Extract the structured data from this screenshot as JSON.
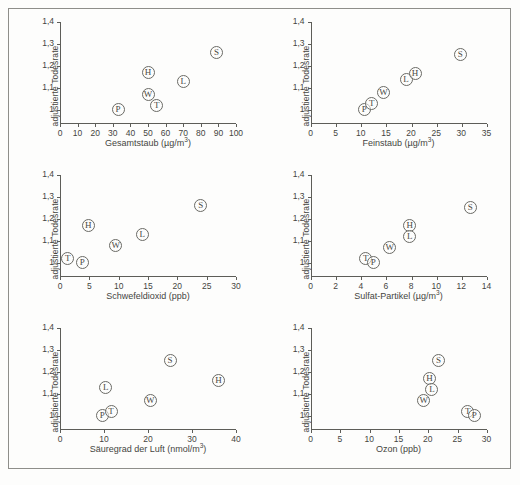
{
  "figure": {
    "background": "#fdfdfc",
    "frame_color": "#8e8e8a",
    "axis_color": "#5d5d58",
    "marker_color": "#6a6a65",
    "ylabel": "adjustierte Todesrate",
    "y_ticks": [
      "1",
      "1,1",
      "1,2",
      "1,3",
      "1,4"
    ],
    "city_codes": [
      "P",
      "T",
      "W",
      "L",
      "H",
      "S"
    ]
  },
  "chart_data": [
    {
      "type": "scatter",
      "title": "",
      "xlabel": "Gesamtstaub (µg/m³)",
      "xlabel_base": "Gesamtstaub (µg/m",
      "xlabel_sup": "3",
      "xlabel_tail": ")",
      "ylabel": "adjustierte Todesrate",
      "xlim": [
        0,
        100
      ],
      "ylim": [
        0.94,
        1.4
      ],
      "xticks": [
        0,
        10,
        20,
        30,
        40,
        50,
        60,
        70,
        80,
        90,
        100
      ],
      "yticks": [
        1,
        1.1,
        1.2,
        1.3,
        1.4
      ],
      "grid": false,
      "legend": "none",
      "points": [
        {
          "label": "P",
          "x": 33,
          "y": 1.0
        },
        {
          "label": "W",
          "x": 50,
          "y": 1.07
        },
        {
          "label": "T",
          "x": 55,
          "y": 1.02
        },
        {
          "label": "H",
          "x": 50,
          "y": 1.17
        },
        {
          "label": "L",
          "x": 70,
          "y": 1.13
        },
        {
          "label": "S",
          "x": 89,
          "y": 1.26
        }
      ]
    },
    {
      "type": "scatter",
      "title": "",
      "xlabel": "Feinstaub (µg/m³)",
      "xlabel_base": "Feinstaub (µg/m",
      "xlabel_sup": "3",
      "xlabel_tail": ")",
      "ylabel": "adjustierte Todesrate",
      "xlim": [
        0,
        35
      ],
      "ylim": [
        0.94,
        1.4
      ],
      "xticks": [
        0,
        5,
        10,
        15,
        20,
        25,
        30,
        35
      ],
      "yticks": [
        1,
        1.1,
        1.2,
        1.3,
        1.4
      ],
      "grid": false,
      "legend": "none",
      "points": [
        {
          "label": "P",
          "x": 10.7,
          "y": 1.0
        },
        {
          "label": "T",
          "x": 12.2,
          "y": 1.03
        },
        {
          "label": "W",
          "x": 14.5,
          "y": 1.08
        },
        {
          "label": "L",
          "x": 19.0,
          "y": 1.14
        },
        {
          "label": "H",
          "x": 20.8,
          "y": 1.165
        },
        {
          "label": "S",
          "x": 29.8,
          "y": 1.25
        }
      ]
    },
    {
      "type": "scatter",
      "title": "",
      "xlabel": "Schwefeldioxid (ppb)",
      "xlabel_base": "Schwefeldioxid (ppb)",
      "xlabel_sup": "",
      "xlabel_tail": "",
      "ylabel": "adjustierte Todesrate",
      "xlim": [
        0,
        30
      ],
      "ylim": [
        0.94,
        1.4
      ],
      "xticks": [
        0,
        5,
        10,
        15,
        20,
        25,
        30
      ],
      "yticks": [
        1,
        1.1,
        1.2,
        1.3,
        1.4
      ],
      "grid": false,
      "legend": "none",
      "points": [
        {
          "label": "T",
          "x": 1.3,
          "y": 1.02
        },
        {
          "label": "P",
          "x": 3.8,
          "y": 1.0
        },
        {
          "label": "H",
          "x": 4.8,
          "y": 1.17
        },
        {
          "label": "W",
          "x": 9.5,
          "y": 1.08
        },
        {
          "label": "L",
          "x": 14.0,
          "y": 1.13
        },
        {
          "label": "S",
          "x": 24.0,
          "y": 1.26
        }
      ]
    },
    {
      "type": "scatter",
      "title": "",
      "xlabel": "Sulfat-Partikel (µg/m³)",
      "xlabel_base": "Sulfat-Partikel (µg/m",
      "xlabel_sup": "3",
      "xlabel_tail": ")",
      "ylabel": "adjustierte Todesrate",
      "xlim": [
        0,
        14
      ],
      "ylim": [
        0.94,
        1.4
      ],
      "xticks": [
        0,
        2,
        4,
        6,
        8,
        10,
        12,
        14
      ],
      "yticks": [
        1,
        1.1,
        1.2,
        1.3,
        1.4
      ],
      "grid": false,
      "legend": "none",
      "points": [
        {
          "label": "T",
          "x": 4.4,
          "y": 1.02
        },
        {
          "label": "P",
          "x": 5.0,
          "y": 1.0
        },
        {
          "label": "W",
          "x": 6.3,
          "y": 1.07
        },
        {
          "label": "H",
          "x": 7.9,
          "y": 1.17
        },
        {
          "label": "L",
          "x": 7.9,
          "y": 1.12
        },
        {
          "label": "S",
          "x": 12.7,
          "y": 1.25
        }
      ]
    },
    {
      "type": "scatter",
      "title": "",
      "xlabel": "Säuregrad der Luft (nmol/m³)",
      "xlabel_base": "Säuregrad der Luft (nmol/m",
      "xlabel_sup": "3",
      "xlabel_tail": ")",
      "ylabel": "adjustierte Todesrate",
      "xlim": [
        0,
        40
      ],
      "ylim": [
        0.94,
        1.4
      ],
      "xticks": [
        0,
        10,
        20,
        30,
        40
      ],
      "yticks": [
        1,
        1.1,
        1.2,
        1.3,
        1.4
      ],
      "grid": false,
      "legend": "none",
      "points": [
        {
          "label": "P",
          "x": 9.6,
          "y": 1.0
        },
        {
          "label": "T",
          "x": 11.6,
          "y": 1.02
        },
        {
          "label": "L",
          "x": 10.4,
          "y": 1.13
        },
        {
          "label": "W",
          "x": 20.5,
          "y": 1.07
        },
        {
          "label": "S",
          "x": 25.0,
          "y": 1.25
        },
        {
          "label": "H",
          "x": 36.0,
          "y": 1.16
        }
      ]
    },
    {
      "type": "scatter",
      "title": "",
      "xlabel": "Ozon (ppb)",
      "xlabel_base": "Ozon (ppb)",
      "xlabel_sup": "",
      "xlabel_tail": "",
      "ylabel": "adjustierte Todesrate",
      "xlim": [
        0,
        30
      ],
      "ylim": [
        0.94,
        1.4
      ],
      "xticks": [
        0,
        5,
        10,
        15,
        20,
        25,
        30
      ],
      "yticks": [
        1,
        1.1,
        1.2,
        1.3,
        1.4
      ],
      "grid": false,
      "legend": "none",
      "points": [
        {
          "label": "W",
          "x": 19.3,
          "y": 1.07
        },
        {
          "label": "H",
          "x": 20.3,
          "y": 1.17
        },
        {
          "label": "L",
          "x": 20.7,
          "y": 1.12
        },
        {
          "label": "S",
          "x": 21.8,
          "y": 1.25
        },
        {
          "label": "T",
          "x": 26.8,
          "y": 1.02
        },
        {
          "label": "P",
          "x": 27.9,
          "y": 1.0
        }
      ]
    }
  ]
}
